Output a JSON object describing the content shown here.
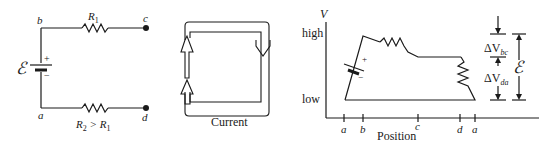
{
  "circuit": {
    "nodes": {
      "a": "a",
      "b": "b",
      "c": "c",
      "d": "d"
    },
    "emf_symbol": "ℰ",
    "plus": "+",
    "minus": "−",
    "r1_label": "R",
    "r1_sub": "1",
    "r2_label_main": "R",
    "r2_sub": "2",
    "r2_rel": " > R",
    "r2_rel_sub": "1"
  },
  "current_diagram": {
    "caption": "Current"
  },
  "potential_graph": {
    "y_axis_label": "V",
    "y_high": "high",
    "y_low": "low",
    "x_axis_label": "Position",
    "x_ticks": [
      "a",
      "b",
      "c",
      "d",
      "a"
    ],
    "delta_bc_base": "ΔV",
    "delta_bc_sub": "bc",
    "delta_da_base": "ΔV",
    "delta_da_sub": "da",
    "emf_symbol": "ℰ",
    "plus": "+",
    "minus": "−"
  },
  "colors": {
    "line": "#1a1a1a",
    "background": "#ffffff"
  }
}
